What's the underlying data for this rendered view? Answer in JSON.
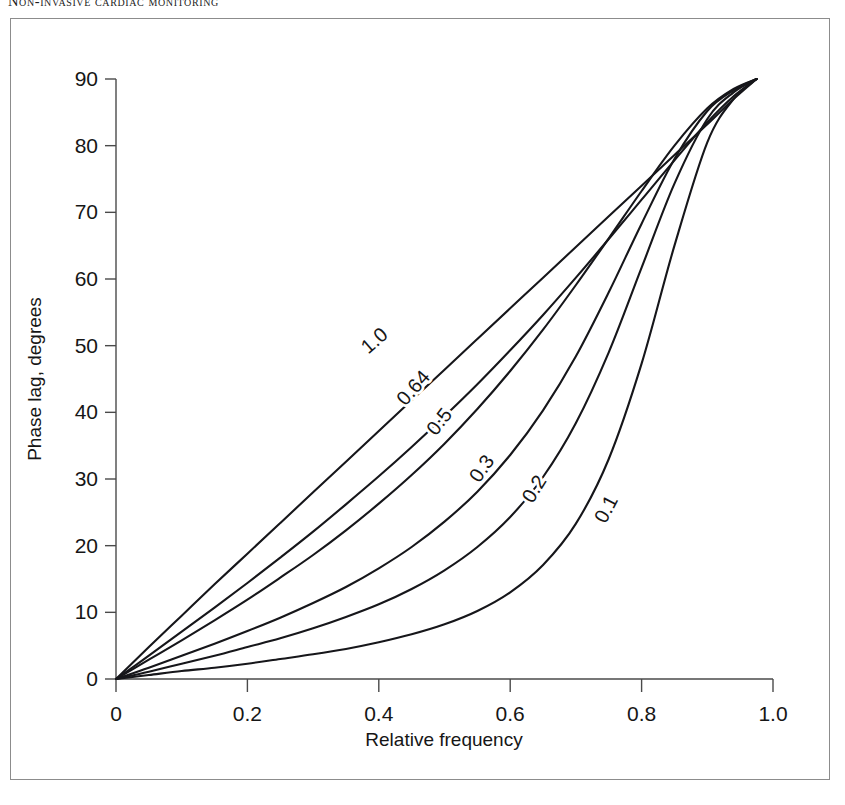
{
  "running_head": "Non-invasive cardiac monitoring",
  "figure": {
    "frame_color": "#8c8c8c",
    "background": "#ffffff"
  },
  "chart_data": {
    "type": "line",
    "title": "",
    "subtitle": "",
    "xlabel": "Relative frequency",
    "ylabel": "Phase lag, degrees",
    "xlim": [
      0,
      1.0
    ],
    "ylim": [
      0,
      90
    ],
    "xticks": [
      0,
      0.2,
      0.4,
      0.6,
      0.8,
      1.0
    ],
    "xticklabels": [
      "0",
      "0.2",
      "0.4",
      "0.6",
      "0.8",
      "1.0"
    ],
    "yticks": [
      0,
      10,
      20,
      30,
      40,
      50,
      60,
      70,
      80,
      90
    ],
    "yticklabels": [
      "0",
      "10",
      "20",
      "30",
      "40",
      "50",
      "60",
      "70",
      "80",
      "90"
    ],
    "grid": false,
    "legend": "inline-curve-labels",
    "line_color": "#16161a",
    "convergence_point": {
      "x": 0.975,
      "y": 90
    },
    "series": [
      {
        "name": "1.0",
        "label": "1.0",
        "damping": 1.0,
        "label_position": {
          "x": 0.4,
          "y": 50
        },
        "label_rotation": -41,
        "x": [
          0,
          0.05,
          0.1,
          0.15,
          0.2,
          0.25,
          0.3,
          0.35,
          0.4,
          0.45,
          0.5,
          0.55,
          0.6,
          0.65,
          0.7,
          0.75,
          0.8,
          0.85,
          0.9,
          0.94,
          0.975
        ],
        "values": [
          0,
          4.8,
          9.5,
          14.2,
          18.8,
          23.4,
          28.0,
          32.6,
          37.2,
          41.8,
          46.4,
          51.0,
          55.6,
          60.2,
          64.8,
          69.4,
          74.0,
          78.6,
          83.2,
          87.0,
          90
        ]
      },
      {
        "name": "0.64",
        "label": "0.64",
        "damping": 0.64,
        "label_position": {
          "x": 0.46,
          "y": 43
        },
        "label_rotation": -48,
        "x": [
          0,
          0.05,
          0.1,
          0.15,
          0.2,
          0.25,
          0.3,
          0.35,
          0.4,
          0.45,
          0.5,
          0.55,
          0.6,
          0.65,
          0.7,
          0.75,
          0.8,
          0.85,
          0.9,
          0.94,
          0.975
        ],
        "values": [
          0,
          3.5,
          7.1,
          10.7,
          14.4,
          18.2,
          22.1,
          26.2,
          30.4,
          34.8,
          39.4,
          44.2,
          49.3,
          54.6,
          60.2,
          66.0,
          71.9,
          77.8,
          83.5,
          87.4,
          90
        ]
      },
      {
        "name": "0.5",
        "label": "0.5",
        "damping": 0.5,
        "label_position": {
          "x": 0.5,
          "y": 38
        },
        "label_rotation": -52,
        "x": [
          0,
          0.05,
          0.1,
          0.15,
          0.2,
          0.25,
          0.3,
          0.35,
          0.4,
          0.45,
          0.5,
          0.55,
          0.6,
          0.65,
          0.7,
          0.75,
          0.8,
          0.85,
          0.9,
          0.94,
          0.975
        ],
        "values": [
          0,
          2.9,
          5.8,
          8.8,
          11.9,
          15.2,
          18.6,
          22.3,
          26.3,
          30.6,
          35.3,
          40.5,
          46.2,
          52.4,
          59.1,
          66.1,
          73.2,
          80.0,
          85.6,
          88.5,
          90
        ]
      },
      {
        "name": "0.3",
        "label": "0.3",
        "damping": 0.3,
        "label_position": {
          "x": 0.565,
          "y": 31
        },
        "label_rotation": -55,
        "x": [
          0,
          0.05,
          0.1,
          0.15,
          0.2,
          0.25,
          0.3,
          0.35,
          0.4,
          0.45,
          0.5,
          0.55,
          0.6,
          0.65,
          0.7,
          0.75,
          0.8,
          0.85,
          0.9,
          0.94,
          0.975
        ],
        "values": [
          0,
          1.7,
          3.5,
          5.3,
          7.2,
          9.2,
          11.4,
          13.8,
          16.6,
          19.8,
          23.6,
          28.1,
          33.6,
          40.3,
          48.4,
          58.0,
          68.3,
          78.0,
          85.2,
          88.3,
          90
        ]
      },
      {
        "name": "0.2",
        "label": "0.2",
        "damping": 0.2,
        "label_position": {
          "x": 0.645,
          "y": 28
        },
        "label_rotation": -58,
        "x": [
          0,
          0.05,
          0.1,
          0.15,
          0.2,
          0.25,
          0.3,
          0.35,
          0.4,
          0.45,
          0.5,
          0.55,
          0.6,
          0.65,
          0.7,
          0.75,
          0.8,
          0.85,
          0.9,
          0.94,
          0.975
        ],
        "values": [
          0,
          1.1,
          2.3,
          3.5,
          4.8,
          6.1,
          7.6,
          9.3,
          11.2,
          13.5,
          16.3,
          19.8,
          24.3,
          30.3,
          38.4,
          49.0,
          61.7,
          74.3,
          84.0,
          88.0,
          90
        ]
      },
      {
        "name": "0.1",
        "label": "0.1",
        "damping": 0.1,
        "label_position": {
          "x": 0.755,
          "y": 25
        },
        "label_rotation": -62,
        "x": [
          0,
          0.05,
          0.1,
          0.15,
          0.2,
          0.25,
          0.3,
          0.35,
          0.4,
          0.45,
          0.5,
          0.55,
          0.6,
          0.65,
          0.7,
          0.75,
          0.8,
          0.85,
          0.9,
          0.94,
          0.975
        ],
        "values": [
          0,
          0.6,
          1.2,
          1.7,
          2.3,
          3.0,
          3.7,
          4.5,
          5.5,
          6.7,
          8.2,
          10.2,
          13.0,
          17.1,
          23.3,
          33.0,
          47.3,
          65.0,
          80.5,
          87.0,
          90
        ]
      }
    ]
  }
}
